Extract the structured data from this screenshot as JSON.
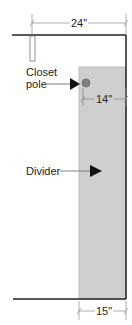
{
  "diagram": {
    "type": "closet-plan-view",
    "labels": {
      "closet_pole": "Closet\npole",
      "closet_pole_line1": "Closet",
      "closet_pole_line2": "pole",
      "divider": "Divider"
    },
    "dimensions": {
      "top_width": "24\"",
      "pole_offset": "14\"",
      "divider_depth": "15\""
    },
    "colors": {
      "wall": "#222222",
      "divider_fill": "#cfcfcf",
      "pole_fill": "#808080",
      "dimension_line": "#9a9a9a",
      "text": "#222222"
    }
  }
}
